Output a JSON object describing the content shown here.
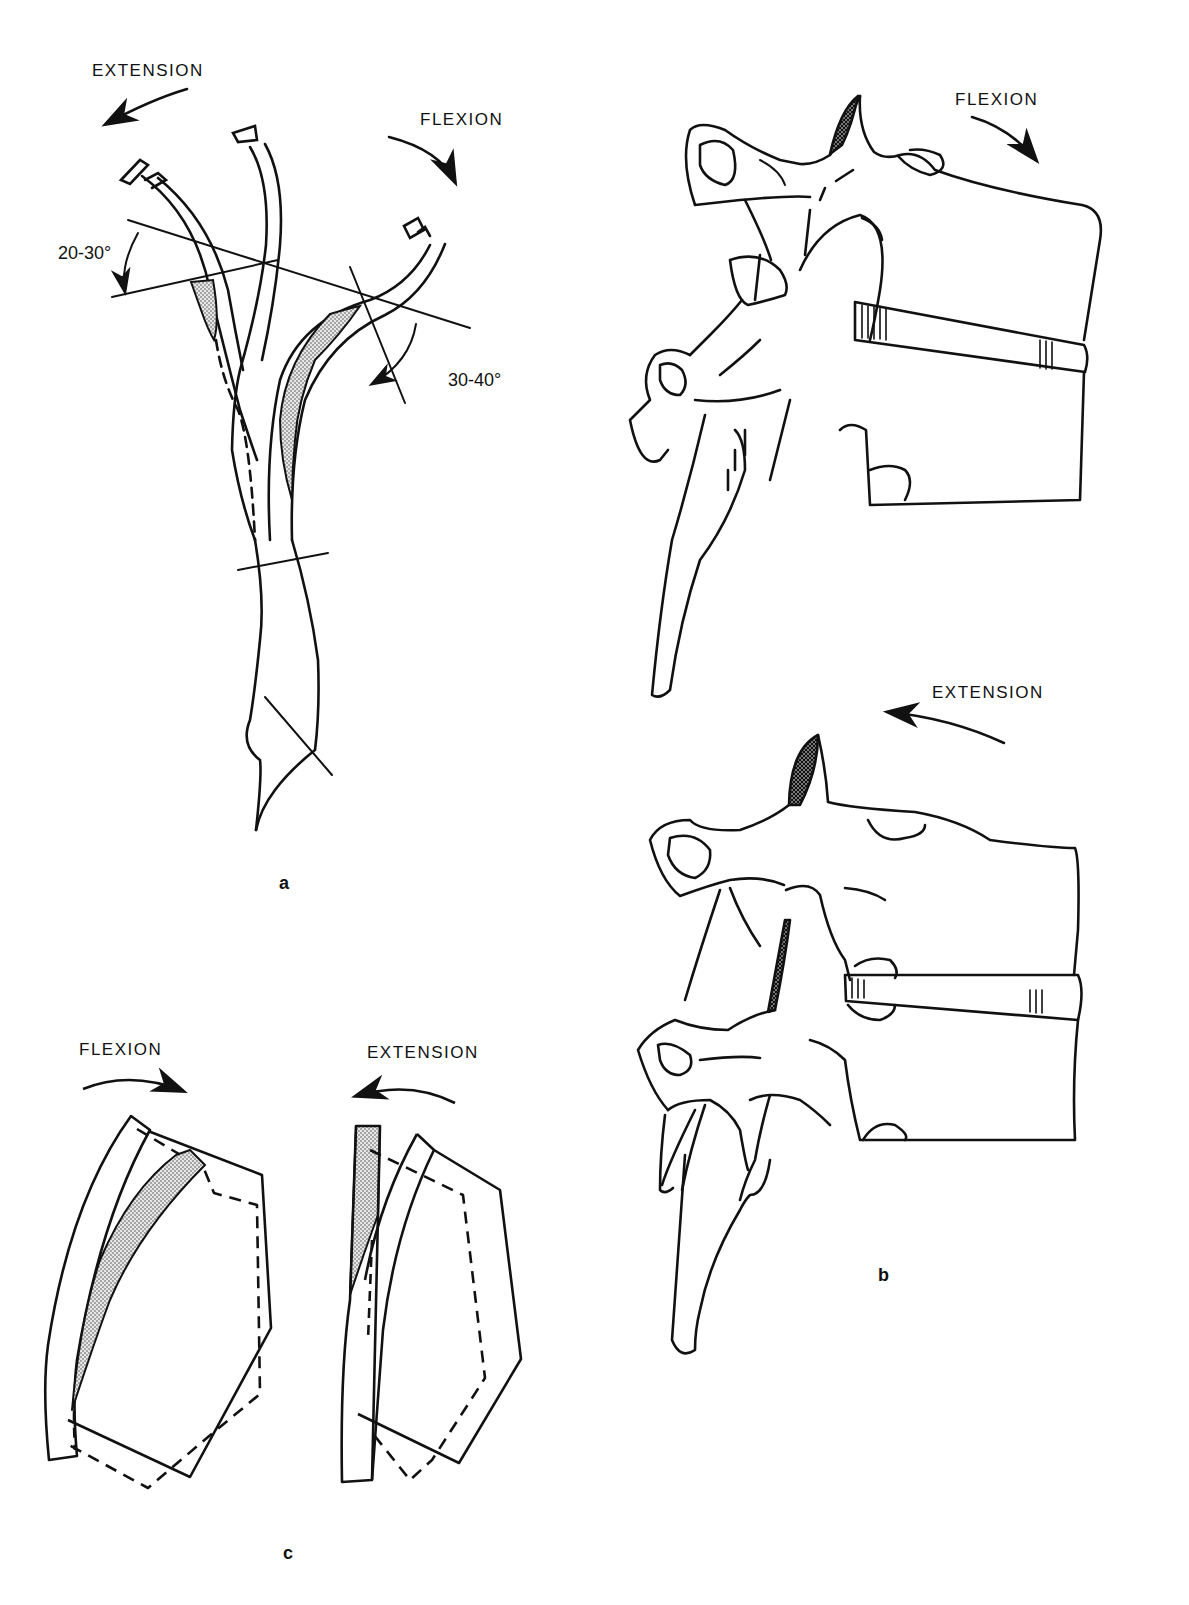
{
  "figure": {
    "panels": [
      {
        "id": "a",
        "label": "a",
        "description": "Spinal curvature in extension, neutral and flexion with angle measurements",
        "arrows": [
          {
            "label": "EXTENSION",
            "direction": "counterclockwise-left"
          },
          {
            "label": "FLEXION",
            "direction": "clockwise-right"
          }
        ],
        "angles": [
          {
            "label": "20-30°",
            "motion": "extension"
          },
          {
            "label": "30-40°",
            "motion": "flexion"
          }
        ]
      },
      {
        "id": "b",
        "label": "b",
        "description": "Lateral view of lumbar vertebral motion segment in flexion (top) and extension (bottom)",
        "arrows": [
          {
            "label": "FLEXION",
            "direction": "clockwise-right"
          },
          {
            "label": "EXTENSION",
            "direction": "counterclockwise-left"
          }
        ]
      },
      {
        "id": "c",
        "label": "c",
        "description": "Schematic segment displacement in flexion and extension (solid vs dashed outlines)",
        "arrows": [
          {
            "label": "FLEXION",
            "direction": "clockwise-right"
          },
          {
            "label": "EXTENSION",
            "direction": "counterclockwise-left"
          }
        ]
      }
    ],
    "colors": {
      "ink": "#111111",
      "shading": "#bdbdbd",
      "background": "#ffffff"
    }
  }
}
